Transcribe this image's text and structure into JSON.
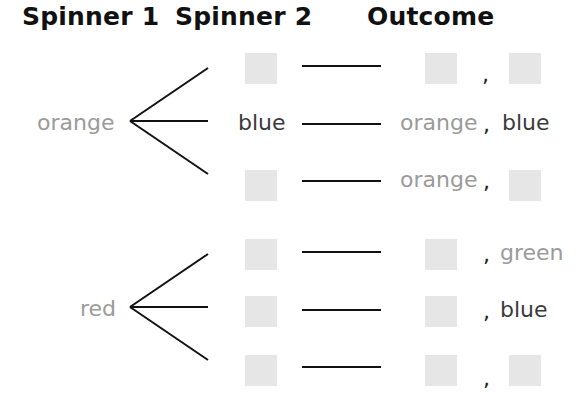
{
  "headers": {
    "spinner1": "Spinner 1",
    "spinner2": "Spinner 2",
    "outcome": "Outcome"
  },
  "groups": [
    {
      "spinner1": "orange",
      "branches": [
        {
          "spinner2": "",
          "outcome_first": "",
          "outcome_second": ""
        },
        {
          "spinner2": "blue",
          "outcome_first": "orange",
          "outcome_second": "blue"
        },
        {
          "spinner2": "",
          "outcome_first": "orange",
          "outcome_second": ""
        }
      ]
    },
    {
      "spinner1": "red",
      "branches": [
        {
          "spinner2": "",
          "outcome_first": "",
          "outcome_second": "green"
        },
        {
          "spinner2": "",
          "outcome_first": "",
          "outcome_second": "blue"
        },
        {
          "spinner2": "",
          "outcome_first": "",
          "outcome_second": ""
        }
      ]
    }
  ],
  "comma": ","
}
